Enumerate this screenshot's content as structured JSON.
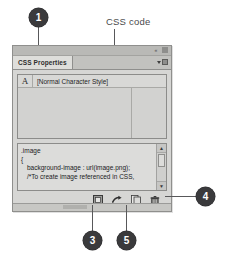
{
  "figure": {
    "css_code_label": "CSS code"
  },
  "callouts": [
    {
      "id": "callout-1",
      "number": "1"
    },
    {
      "id": "callout-3",
      "number": "3"
    },
    {
      "id": "callout-4",
      "number": "4"
    },
    {
      "id": "callout-5",
      "number": "5"
    }
  ],
  "panel": {
    "tab_label": "CSS Properties",
    "window_controls": {
      "collapse_label": "«",
      "close_label": "×"
    },
    "panel_menu_icon": "panel-menu-icon",
    "style_list": {
      "rows": [
        {
          "glyph": "A",
          "name": "[Normal Character Style]"
        }
      ]
    },
    "code_lines": [
      ".image",
      "{",
      "background-image : url(image.png);",
      "/*To create image referenced in CSS,"
    ],
    "scrollbar": {
      "up_arrow": "▲",
      "down_arrow": "▼"
    },
    "toolbar_icons": [
      {
        "name": "new-style-icon"
      },
      {
        "name": "share-arrow-icon"
      },
      {
        "name": "duplicate-page-icon"
      },
      {
        "name": "delete-trash-icon"
      }
    ]
  },
  "colors": {
    "panel_face": "#d6d6d4",
    "panel_border": "#8f8f8d",
    "tab_active": "#dededb",
    "callout_fill": "#3a3a3c",
    "leader": "#58585a",
    "text": "#1f1f1f"
  }
}
